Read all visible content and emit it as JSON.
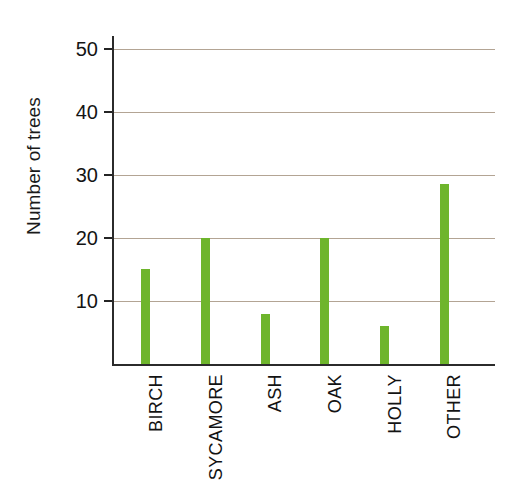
{
  "chart_data": {
    "type": "bar",
    "title": "",
    "subtitle": "",
    "xlabel": "",
    "ylabel": "Number of trees",
    "categories": [
      "BIRCH",
      "SYCAMORE",
      "ASH",
      "OAK",
      "HOLLY",
      "OTHER"
    ],
    "values": [
      15,
      20,
      8,
      20,
      6,
      28.5
    ],
    "ylim": [
      0,
      52
    ],
    "yticks": [
      10,
      20,
      30,
      40,
      50
    ],
    "ytick_labels": [
      "10",
      "20",
      "30",
      "40",
      "50"
    ],
    "grid": true,
    "grid_axis": "y",
    "legend": false,
    "legend_position": "none",
    "bar_color": "#6eb52c",
    "grid_color": "#b3a494",
    "axis_color": "#2b2b2b",
    "background_color": "#ffffff"
  },
  "axes": {
    "y_title": "Number of trees"
  }
}
